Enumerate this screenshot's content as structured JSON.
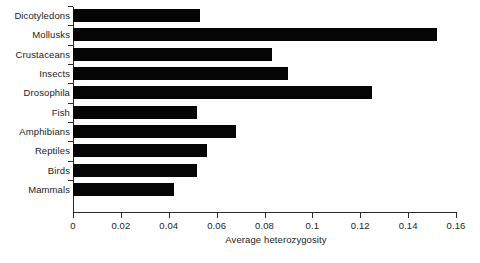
{
  "chart_data": {
    "type": "bar",
    "orientation": "horizontal",
    "title": "",
    "xlabel": "Average heterozygosity",
    "ylabel": "",
    "xlim": [
      0,
      0.16
    ],
    "xticks": [
      "0",
      "0.02",
      "0.04",
      "0.06",
      "0.08",
      "0.1",
      "0.12",
      "0.14",
      "0.16"
    ],
    "xtick_values": [
      0,
      0.02,
      0.04,
      0.06,
      0.08,
      0.1,
      0.12,
      0.14,
      0.16
    ],
    "grid": false,
    "legend": null,
    "bar_color": "#050505",
    "background_color": "#ffffff",
    "axis_color": "#2b2b2b",
    "categories": [
      "Dicotyledons",
      "Mollusks",
      "Crustaceans",
      "Insects",
      "Drosophila",
      "Fish",
      "Amphibians",
      "Reptiles",
      "Birds",
      "Mammals"
    ],
    "values": [
      0.053,
      0.152,
      0.083,
      0.09,
      0.125,
      0.052,
      0.068,
      0.056,
      0.052,
      0.042
    ]
  }
}
